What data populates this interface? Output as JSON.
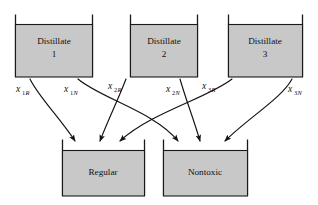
{
  "diagram": {
    "type": "flow-network",
    "colors": {
      "tank_fill": "#c8c8c8",
      "stroke": "#1a1a1a",
      "background": "#ffffff"
    },
    "source_tanks": [
      {
        "id": "distillate-1",
        "name_line1": "Distillate",
        "name_line2": "1",
        "x": 15,
        "y": 20,
        "w": 78,
        "h": 57
      },
      {
        "id": "distillate-2",
        "name_line1": "Distillate",
        "name_line2": "2",
        "x": 130,
        "y": 20,
        "w": 68,
        "h": 57
      },
      {
        "id": "distillate-3",
        "name_line1": "Distillate",
        "name_line2": "3",
        "x": 228,
        "y": 20,
        "w": 75,
        "h": 57
      }
    ],
    "dest_tanks": [
      {
        "id": "regular",
        "name_line1": "Regular",
        "name_line2": "",
        "x": 62,
        "y": 146,
        "w": 83,
        "h": 50
      },
      {
        "id": "nontoxic",
        "name_line1": "Nontoxic",
        "name_line2": "",
        "x": 163,
        "y": 146,
        "w": 85,
        "h": 50
      }
    ],
    "flows": [
      {
        "id": "flow-1R",
        "base": "x",
        "sub": "1R",
        "sub_digit": "1",
        "sub_letter": "R",
        "from": "distillate-1",
        "to": "regular",
        "label_x": 16,
        "label_y": 92
      },
      {
        "id": "flow-1N",
        "base": "x",
        "sub": "1N",
        "sub_digit": "1",
        "sub_letter": "N",
        "from": "distillate-1",
        "to": "nontoxic",
        "label_x": 64,
        "label_y": 92
      },
      {
        "id": "flow-2R",
        "base": "x",
        "sub": "2R",
        "sub_digit": "2",
        "sub_letter": "R",
        "from": "distillate-2",
        "to": "regular",
        "label_x": 108,
        "label_y": 89
      },
      {
        "id": "flow-2N",
        "base": "x",
        "sub": "2N",
        "sub_digit": "2",
        "sub_letter": "N",
        "from": "distillate-2",
        "to": "nontoxic",
        "label_x": 166,
        "label_y": 92
      },
      {
        "id": "flow-3R",
        "base": "x",
        "sub": "3R",
        "sub_digit": "3",
        "sub_letter": "R",
        "from": "distillate-3",
        "to": "regular",
        "label_x": 202,
        "label_y": 89
      },
      {
        "id": "flow-3N",
        "base": "x",
        "sub": "3N",
        "sub_digit": "3",
        "sub_letter": "N",
        "from": "distillate-3",
        "to": "nontoxic",
        "label_x": 288,
        "label_y": 92
      }
    ]
  }
}
